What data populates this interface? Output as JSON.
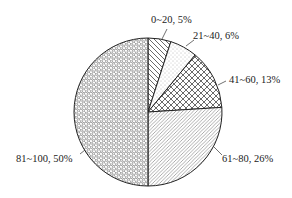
{
  "chart_data": {
    "type": "pie",
    "title": "",
    "categories": [
      "0~20",
      "21~40",
      "41~60",
      "61~80",
      "81~100"
    ],
    "values": [
      5,
      6,
      13,
      26,
      50
    ],
    "unit": "%",
    "labels": [
      "0~20, 5%",
      "21~40, 6%",
      "41~60, 13%",
      "61~80, 26%",
      "81~100, 50%"
    ],
    "start_angle_deg": 0,
    "direction": "clockwise",
    "fill_patterns": [
      "diagonal-backslash",
      "stipple-dots",
      "crosshatch-diamond",
      "diagonal-fine-slash",
      "hexagon-mesh"
    ],
    "legend": "none (direct labels with leader lines)",
    "colors": {
      "outline": "#222222",
      "fill": "#ffffff",
      "pattern": "#555555"
    }
  },
  "labels": {
    "s0": "0~20, 5%",
    "s1": "21~40, 6%",
    "s2": "41~60, 13%",
    "s3": "61~80, 26%",
    "s4": "81~100, 50%"
  }
}
